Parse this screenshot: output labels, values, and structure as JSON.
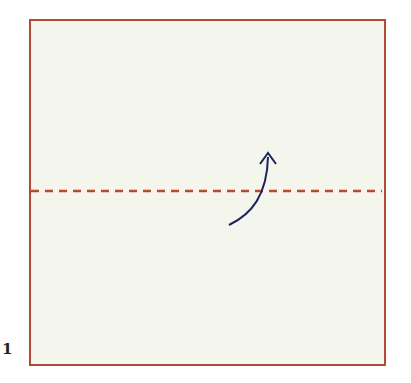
{
  "diagram": {
    "step_number": "1",
    "paper": {
      "shape": "square",
      "color": "#f4f5ec",
      "edge_color": "#b24a3a"
    },
    "fold_line": {
      "type": "valley-fold",
      "style": "dashed",
      "orientation": "horizontal",
      "color": "#b8482e"
    },
    "arrow": {
      "icon": "fold-up-arrow",
      "direction": "up",
      "color": "#1e2460"
    }
  }
}
